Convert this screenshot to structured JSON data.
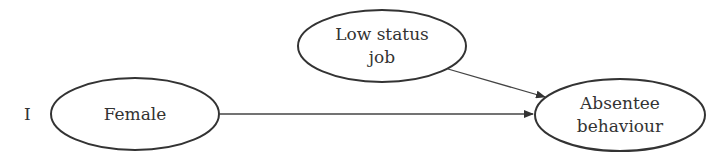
{
  "panel_label": "I",
  "nodes": {
    "female": {
      "label": "Female"
    },
    "low_status_job": {
      "line1": "Low status",
      "line2": "job"
    },
    "absentee_behaviour": {
      "line1": "Absentee",
      "line2": "behaviour"
    }
  },
  "edges": [
    {
      "from": "Female",
      "to": "Absentee behaviour"
    },
    {
      "from": "Low status job",
      "to": "Absentee behaviour"
    }
  ],
  "colors": {
    "stroke": "#333333",
    "text": "#333333",
    "background": "#ffffff"
  }
}
